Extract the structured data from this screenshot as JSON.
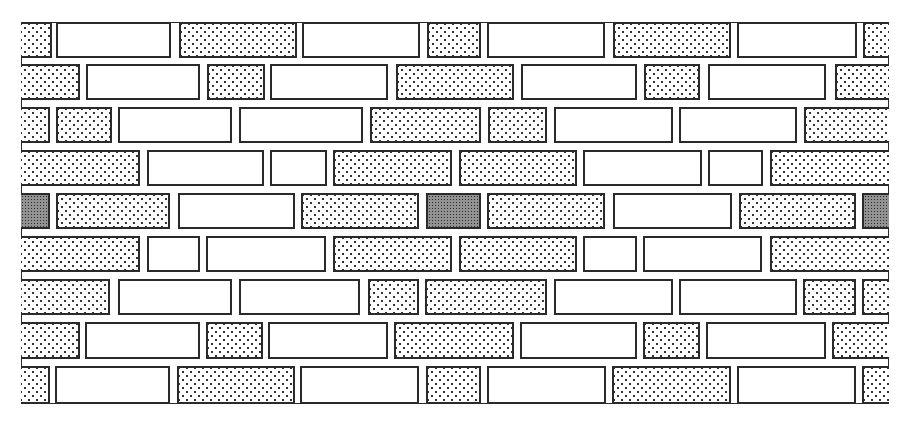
{
  "diagram": {
    "type": "brick-wall-bond-pattern",
    "frame": {
      "x": 21,
      "y": 22,
      "w": 868,
      "h": 382
    },
    "legend": {
      "plain": "plain brick (white)",
      "dotted": "stippled brick (light dot pattern)",
      "dense": "dense stippled brick (dark gray)"
    },
    "courses": [
      {
        "y": 22,
        "h": 36,
        "bricks": [
          {
            "x1": 21,
            "x2": 52,
            "fill": "dotted"
          },
          {
            "x1": 56,
            "x2": 171,
            "fill": "plain"
          },
          {
            "x1": 179,
            "x2": 297,
            "fill": "dotted"
          },
          {
            "x1": 302,
            "x2": 420,
            "fill": "plain"
          },
          {
            "x1": 427,
            "x2": 481,
            "fill": "dotted"
          },
          {
            "x1": 487,
            "x2": 605,
            "fill": "plain"
          },
          {
            "x1": 613,
            "x2": 731,
            "fill": "dotted"
          },
          {
            "x1": 737,
            "x2": 857,
            "fill": "plain"
          },
          {
            "x1": 863,
            "x2": 889,
            "fill": "dotted"
          }
        ]
      },
      {
        "y": 64,
        "h": 36,
        "bricks": [
          {
            "x1": 21,
            "x2": 80,
            "fill": "dotted"
          },
          {
            "x1": 86,
            "x2": 200,
            "fill": "plain"
          },
          {
            "x1": 207,
            "x2": 265,
            "fill": "dotted"
          },
          {
            "x1": 270,
            "x2": 388,
            "fill": "plain"
          },
          {
            "x1": 396,
            "x2": 514,
            "fill": "dotted"
          },
          {
            "x1": 521,
            "x2": 637,
            "fill": "plain"
          },
          {
            "x1": 644,
            "x2": 700,
            "fill": "dotted"
          },
          {
            "x1": 708,
            "x2": 826,
            "fill": "plain"
          },
          {
            "x1": 835,
            "x2": 889,
            "fill": "dotted"
          }
        ]
      },
      {
        "y": 107,
        "h": 36,
        "bricks": [
          {
            "x1": 21,
            "x2": 50,
            "fill": "dotted"
          },
          {
            "x1": 56,
            "x2": 112,
            "fill": "dotted"
          },
          {
            "x1": 118,
            "x2": 232,
            "fill": "plain"
          },
          {
            "x1": 239,
            "x2": 363,
            "fill": "plain"
          },
          {
            "x1": 370,
            "x2": 481,
            "fill": "dotted"
          },
          {
            "x1": 488,
            "x2": 547,
            "fill": "dotted"
          },
          {
            "x1": 554,
            "x2": 673,
            "fill": "plain"
          },
          {
            "x1": 679,
            "x2": 797,
            "fill": "plain"
          },
          {
            "x1": 804,
            "x2": 889,
            "fill": "dotted"
          }
        ]
      },
      {
        "y": 150,
        "h": 36,
        "bricks": [
          {
            "x1": 21,
            "x2": 140,
            "fill": "dotted"
          },
          {
            "x1": 147,
            "x2": 264,
            "fill": "plain"
          },
          {
            "x1": 270,
            "x2": 327,
            "fill": "plain"
          },
          {
            "x1": 333,
            "x2": 452,
            "fill": "dotted"
          },
          {
            "x1": 459,
            "x2": 577,
            "fill": "dotted"
          },
          {
            "x1": 583,
            "x2": 702,
            "fill": "plain"
          },
          {
            "x1": 708,
            "x2": 763,
            "fill": "plain"
          },
          {
            "x1": 770,
            "x2": 889,
            "fill": "dotted"
          }
        ]
      },
      {
        "y": 193,
        "h": 36,
        "bricks": [
          {
            "x1": 21,
            "x2": 50,
            "fill": "dense"
          },
          {
            "x1": 56,
            "x2": 170,
            "fill": "dotted"
          },
          {
            "x1": 178,
            "x2": 295,
            "fill": "plain"
          },
          {
            "x1": 301,
            "x2": 419,
            "fill": "dotted"
          },
          {
            "x1": 426,
            "x2": 481,
            "fill": "dense"
          },
          {
            "x1": 487,
            "x2": 605,
            "fill": "dotted"
          },
          {
            "x1": 613,
            "x2": 732,
            "fill": "plain"
          },
          {
            "x1": 739,
            "x2": 856,
            "fill": "dotted"
          },
          {
            "x1": 862,
            "x2": 889,
            "fill": "dense"
          }
        ]
      },
      {
        "y": 236,
        "h": 36,
        "bricks": [
          {
            "x1": 21,
            "x2": 140,
            "fill": "dotted"
          },
          {
            "x1": 147,
            "x2": 200,
            "fill": "plain"
          },
          {
            "x1": 206,
            "x2": 326,
            "fill": "plain"
          },
          {
            "x1": 333,
            "x2": 452,
            "fill": "dotted"
          },
          {
            "x1": 459,
            "x2": 577,
            "fill": "dotted"
          },
          {
            "x1": 583,
            "x2": 637,
            "fill": "plain"
          },
          {
            "x1": 643,
            "x2": 762,
            "fill": "plain"
          },
          {
            "x1": 770,
            "x2": 889,
            "fill": "dotted"
          }
        ]
      },
      {
        "y": 279,
        "h": 36,
        "bricks": [
          {
            "x1": 21,
            "x2": 110,
            "fill": "dotted"
          },
          {
            "x1": 118,
            "x2": 232,
            "fill": "plain"
          },
          {
            "x1": 239,
            "x2": 360,
            "fill": "plain"
          },
          {
            "x1": 368,
            "x2": 419,
            "fill": "dotted"
          },
          {
            "x1": 425,
            "x2": 547,
            "fill": "dotted"
          },
          {
            "x1": 554,
            "x2": 673,
            "fill": "plain"
          },
          {
            "x1": 679,
            "x2": 797,
            "fill": "plain"
          },
          {
            "x1": 803,
            "x2": 856,
            "fill": "dotted"
          },
          {
            "x1": 862,
            "x2": 889,
            "fill": "dotted"
          }
        ]
      },
      {
        "y": 322,
        "h": 37,
        "bricks": [
          {
            "x1": 21,
            "x2": 80,
            "fill": "dotted"
          },
          {
            "x1": 85,
            "x2": 200,
            "fill": "plain"
          },
          {
            "x1": 206,
            "x2": 263,
            "fill": "dotted"
          },
          {
            "x1": 268,
            "x2": 388,
            "fill": "plain"
          },
          {
            "x1": 394,
            "x2": 514,
            "fill": "dotted"
          },
          {
            "x1": 520,
            "x2": 637,
            "fill": "plain"
          },
          {
            "x1": 643,
            "x2": 700,
            "fill": "dotted"
          },
          {
            "x1": 706,
            "x2": 826,
            "fill": "plain"
          },
          {
            "x1": 832,
            "x2": 889,
            "fill": "dotted"
          }
        ]
      },
      {
        "y": 366,
        "h": 38,
        "bricks": [
          {
            "x1": 21,
            "x2": 50,
            "fill": "dotted"
          },
          {
            "x1": 55,
            "x2": 170,
            "fill": "plain"
          },
          {
            "x1": 177,
            "x2": 295,
            "fill": "dotted"
          },
          {
            "x1": 300,
            "x2": 419,
            "fill": "plain"
          },
          {
            "x1": 426,
            "x2": 481,
            "fill": "dotted"
          },
          {
            "x1": 487,
            "x2": 606,
            "fill": "plain"
          },
          {
            "x1": 612,
            "x2": 731,
            "fill": "dotted"
          },
          {
            "x1": 737,
            "x2": 856,
            "fill": "plain"
          },
          {
            "x1": 862,
            "x2": 889,
            "fill": "dotted"
          }
        ]
      }
    ]
  }
}
